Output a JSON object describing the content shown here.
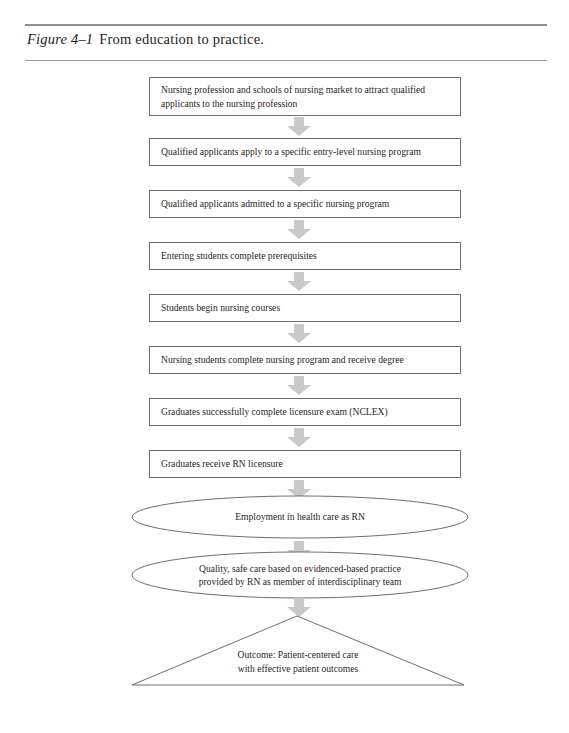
{
  "figure": {
    "label": "Figure 4–1",
    "title": "From education to practice.",
    "accent_rule_color": "#8f8f8f"
  },
  "diagram": {
    "arrow_color": "#c9c9c9",
    "node_border_color": "#6e6e72",
    "arrow_icon_name": "down-block-arrow-icon",
    "nodes": [
      {
        "shape": "rectangle",
        "name": "step-market-to-attract-applicants",
        "lines": [
          "Nursing profession and schools of nursing market to attract qualified",
          "applicants to the nursing profession"
        ]
      },
      {
        "shape": "rectangle",
        "name": "step-apply-to-entry-level-program",
        "lines": [
          "Qualified applicants apply to a specific entry-level nursing program"
        ]
      },
      {
        "shape": "rectangle",
        "name": "step-admitted-to-nursing-program",
        "lines": [
          "Qualified applicants admitted to a specific nursing program"
        ]
      },
      {
        "shape": "rectangle",
        "name": "step-complete-prerequisites",
        "lines": [
          "Entering students complete prerequisites"
        ]
      },
      {
        "shape": "rectangle",
        "name": "step-begin-nursing-courses",
        "lines": [
          "Students begin nursing courses"
        ]
      },
      {
        "shape": "rectangle",
        "name": "step-complete-program-receive-degree",
        "lines": [
          "Nursing students complete nursing program and receive degree"
        ]
      },
      {
        "shape": "rectangle",
        "name": "step-complete-nclex-exam",
        "lines": [
          "Graduates successfully complete licensure exam (NCLEX)"
        ]
      },
      {
        "shape": "rectangle",
        "name": "step-receive-rn-licensure",
        "lines": [
          "Graduates receive RN licensure"
        ]
      },
      {
        "shape": "ellipse",
        "name": "step-employment-in-health-care",
        "lines": [
          "Employment in health care as RN"
        ]
      },
      {
        "shape": "ellipse",
        "name": "step-quality-safe-care",
        "lines": [
          "Quality, safe care based on evidenced-based practice",
          "provided by RN as member of interdisciplinary team"
        ]
      },
      {
        "shape": "triangle",
        "name": "step-outcome-patient-centered-care",
        "lines": [
          "Outcome: Patient-centered care",
          "with effective patient outcomes"
        ]
      }
    ]
  }
}
